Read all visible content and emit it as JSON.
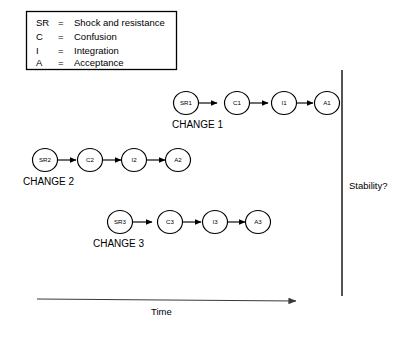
{
  "diagram": {
    "background_color": "#ffffff",
    "line_color": "#000000"
  },
  "legend": {
    "name": "abbreviation-legend",
    "equals_sign": "=",
    "entries": [
      {
        "key": "SR",
        "definition": "Shock and resistance"
      },
      {
        "key": "C",
        "definition": "Confusion"
      },
      {
        "key": "I",
        "definition": "Integration"
      },
      {
        "key": "A",
        "definition": "Acceptance"
      }
    ]
  },
  "change_rows": [
    {
      "label": "CHANGE 1",
      "nodes": [
        {
          "text": "SR1"
        },
        {
          "text": "C1"
        },
        {
          "text": "I1"
        },
        {
          "text": "A1"
        }
      ]
    },
    {
      "label": "CHANGE 2",
      "nodes": [
        {
          "text": "SR2"
        },
        {
          "text": "C2"
        },
        {
          "text": "I2"
        },
        {
          "text": "A2"
        }
      ]
    },
    {
      "label": "CHANGE 3",
      "nodes": [
        {
          "text": "SR3"
        },
        {
          "text": "C3"
        },
        {
          "text": "I3"
        },
        {
          "text": "A3"
        }
      ]
    }
  ],
  "time_axis": {
    "label": "Time"
  },
  "stability_axis": {
    "label": "Stability?"
  }
}
